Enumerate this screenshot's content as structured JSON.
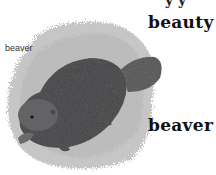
{
  "image": {
    "subject": "beaver illustration",
    "caption_small": "beaver",
    "words": [
      "beauty",
      "beaver"
    ],
    "top_partial_text": "y y"
  },
  "colors": {
    "background": "#ffffff",
    "splash": "#c4c4c4",
    "body": "#5a5a5c",
    "tail": "#6a6a6c",
    "text": "#111111"
  }
}
